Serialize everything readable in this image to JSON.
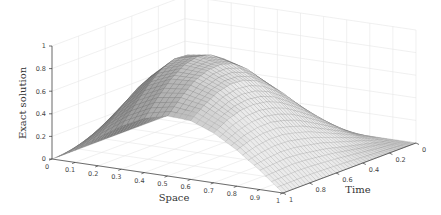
{
  "chart_data": {
    "type": "surface",
    "title": "",
    "xlabel": "Space",
    "ylabel": "Time",
    "zlabel": "Exact solution",
    "xlim": [
      0,
      1
    ],
    "ylim": [
      0,
      1
    ],
    "zlim": [
      0,
      1
    ],
    "x_ticks": [
      "0",
      "0.1",
      "0.2",
      "0.3",
      "0.4",
      "0.5",
      "0.6",
      "0.7",
      "0.8",
      "0.9",
      "1"
    ],
    "y_ticks": [
      "0",
      "0.2",
      "0.4",
      "0.6",
      "0.8",
      "1"
    ],
    "z_ticks": [
      "0",
      "0.2",
      "0.4",
      "0.6",
      "0.8",
      "1"
    ],
    "grid": true,
    "colormap": "gray",
    "x": [
      0,
      0.1,
      0.2,
      0.3,
      0.4,
      0.5,
      0.6,
      0.7,
      0.8,
      0.9,
      1
    ],
    "y": [
      0,
      0.1,
      0.2,
      0.3,
      0.4,
      0.5,
      0.6,
      0.7,
      0.8,
      0.9,
      1
    ],
    "z_note": "rows indexed by Time (y), columns by Space (x); approximate values read from the surface",
    "z": [
      [
        0,
        0.0,
        0.0,
        0.0,
        0.0,
        0.0,
        0.0,
        0.0,
        0.0,
        0.0,
        0
      ],
      [
        0,
        0.12,
        0.2,
        0.24,
        0.24,
        0.21,
        0.16,
        0.11,
        0.06,
        0.02,
        0
      ],
      [
        0,
        0.22,
        0.37,
        0.44,
        0.44,
        0.39,
        0.31,
        0.22,
        0.13,
        0.05,
        0
      ],
      [
        0,
        0.29,
        0.5,
        0.6,
        0.61,
        0.55,
        0.45,
        0.32,
        0.19,
        0.08,
        0
      ],
      [
        0,
        0.33,
        0.59,
        0.72,
        0.74,
        0.68,
        0.56,
        0.41,
        0.25,
        0.11,
        0
      ],
      [
        0,
        0.34,
        0.63,
        0.79,
        0.82,
        0.77,
        0.65,
        0.49,
        0.31,
        0.14,
        0
      ],
      [
        0,
        0.32,
        0.62,
        0.8,
        0.85,
        0.81,
        0.7,
        0.54,
        0.35,
        0.16,
        0
      ],
      [
        0,
        0.28,
        0.56,
        0.75,
        0.82,
        0.8,
        0.71,
        0.56,
        0.38,
        0.18,
        0
      ],
      [
        0,
        0.23,
        0.47,
        0.65,
        0.74,
        0.75,
        0.68,
        0.55,
        0.38,
        0.19,
        0
      ],
      [
        0,
        0.17,
        0.36,
        0.52,
        0.62,
        0.65,
        0.61,
        0.51,
        0.36,
        0.18,
        0
      ],
      [
        0,
        0.11,
        0.25,
        0.38,
        0.48,
        0.53,
        0.52,
        0.44,
        0.32,
        0.17,
        0
      ]
    ]
  },
  "axes": {
    "xlabel": "Space",
    "ylabel": "Time",
    "zlabel": "Exact solution"
  }
}
